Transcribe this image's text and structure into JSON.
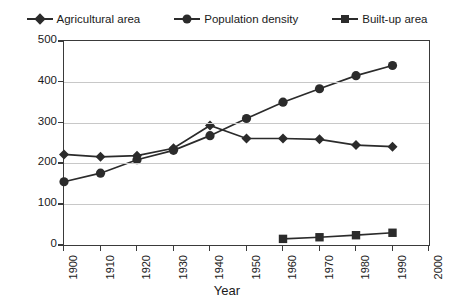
{
  "chart_data": {
    "type": "line",
    "title": "",
    "xlabel": "Year",
    "ylabel": "",
    "x": [
      1900,
      1910,
      1920,
      1930,
      1940,
      1950,
      1960,
      1970,
      1980,
      1990,
      2000
    ],
    "xtick_labels": [
      "1900",
      "1910",
      "1920",
      "1930",
      "1940",
      "1950",
      "1960",
      "1970",
      "1980",
      "1990",
      "2000"
    ],
    "ytick_labels": [
      "0",
      "100",
      "200",
      "300",
      "400",
      "500"
    ],
    "yticks": [
      0,
      100,
      200,
      300,
      400,
      500
    ],
    "ylim": [
      0,
      500
    ],
    "xlim": [
      1900,
      2000
    ],
    "grid": "horizontal",
    "legend_position": "top",
    "series": [
      {
        "name": "Agricultural area",
        "marker": "diamond",
        "color": "#2b2b2b",
        "x": [
          1900,
          1910,
          1920,
          1930,
          1940,
          1950,
          1960,
          1970,
          1980,
          1990
        ],
        "values": [
          222,
          216,
          219,
          237,
          293,
          261,
          261,
          259,
          245,
          241
        ]
      },
      {
        "name": "Population density",
        "marker": "circle",
        "color": "#2b2b2b",
        "x": [
          1900,
          1910,
          1920,
          1930,
          1940,
          1950,
          1960,
          1970,
          1980,
          1990
        ],
        "values": [
          155,
          176,
          209,
          232,
          268,
          310,
          350,
          383,
          415,
          440
        ]
      },
      {
        "name": "Built-up area",
        "marker": "square",
        "color": "#2b2b2b",
        "x": [
          1960,
          1970,
          1980,
          1990
        ],
        "values": [
          15,
          19,
          24,
          30
        ]
      }
    ]
  }
}
